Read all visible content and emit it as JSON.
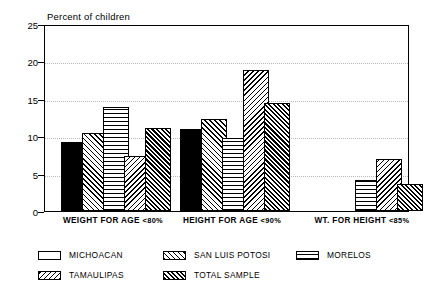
{
  "chart_data": {
    "type": "bar",
    "title": "Percent of children",
    "subtitle": "",
    "xlabel": "",
    "ylabel": "Percent of children",
    "ylim": [
      0,
      25
    ],
    "yticks": [
      0,
      5,
      10,
      15,
      20,
      25
    ],
    "grid": true,
    "legend_position": "bottom",
    "categories": [
      "WEIGHT FOR AGE <80%",
      "HEIGHT FOR AGE <90%",
      "WT. FOR HEIGHT <85%"
    ],
    "series": [
      {
        "name": "MICHOACAN",
        "pattern": "solid",
        "values": [
          9.2,
          11.0,
          null
        ]
      },
      {
        "name": "SAN LUIS POTOSI",
        "pattern": "fwd-diagonal",
        "values": [
          10.4,
          12.3,
          null
        ]
      },
      {
        "name": "MORELOS",
        "pattern": "grid",
        "values": [
          13.9,
          9.7,
          4.1
        ]
      },
      {
        "name": "TAMAULIPAS",
        "pattern": "back-diagonal",
        "values": [
          7.4,
          18.9,
          6.9
        ]
      },
      {
        "name": "TOTAL SAMPLE",
        "pattern": "checkerboard",
        "values": [
          11.1,
          14.5,
          3.6
        ]
      }
    ],
    "colors": {
      "ink": "#000000",
      "background": "#ffffff",
      "gridline": "#b9b9b9"
    }
  },
  "axis": {
    "title": "Percent of children",
    "ytick_labels": [
      "25",
      "20",
      "15",
      "10",
      "5",
      "0"
    ]
  },
  "categories_display": [
    {
      "text": "WEIGHT FOR AGE ",
      "pct": "<80%"
    },
    {
      "text": "HEIGHT FOR AGE ",
      "pct": "<90%"
    },
    {
      "text": "WT. FOR HEIGHT ",
      "pct": "<85%"
    }
  ],
  "legend": {
    "entries": [
      {
        "label": "MICHOACAN",
        "pattern": "solid"
      },
      {
        "label": "SAN LUIS POTOSI",
        "pattern": "fwd-diagonal"
      },
      {
        "label": "MORELOS",
        "pattern": "grid"
      },
      {
        "label": "TAMAULIPAS",
        "pattern": "back-diagonal"
      },
      {
        "label": "TOTAL SAMPLE",
        "pattern": "checkerboard"
      }
    ]
  }
}
